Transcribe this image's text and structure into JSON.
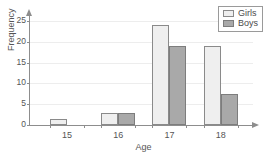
{
  "title_sliver": "grouped bar",
  "legend": {
    "position": "top-right",
    "entries": [
      {
        "label": "Girls",
        "swatch": "girls",
        "color": "#efefef"
      },
      {
        "label": "Boys",
        "swatch": "boys",
        "color": "#a9a9a9"
      }
    ]
  },
  "axes": {
    "x_label": "Age",
    "y_label": "Frequency",
    "y_ticks": [
      "0",
      "5",
      "10",
      "15",
      "20",
      "25"
    ],
    "x_ticks": [
      "15",
      "16",
      "17",
      "18"
    ]
  },
  "chart_data": {
    "type": "bar",
    "title": "",
    "xlabel": "Age",
    "ylabel": "Frequency",
    "categories": [
      "15",
      "16",
      "17",
      "18"
    ],
    "series": [
      {
        "name": "Girls",
        "values": [
          1.5,
          3,
          24,
          19
        ]
      },
      {
        "name": "Boys",
        "values": [
          0,
          3,
          19,
          7.5
        ]
      }
    ],
    "ylim": [
      0,
      25
    ],
    "ytick_step": 5,
    "grid": true,
    "legend_position": "top-right",
    "grouping": "clustered-adjacent"
  }
}
